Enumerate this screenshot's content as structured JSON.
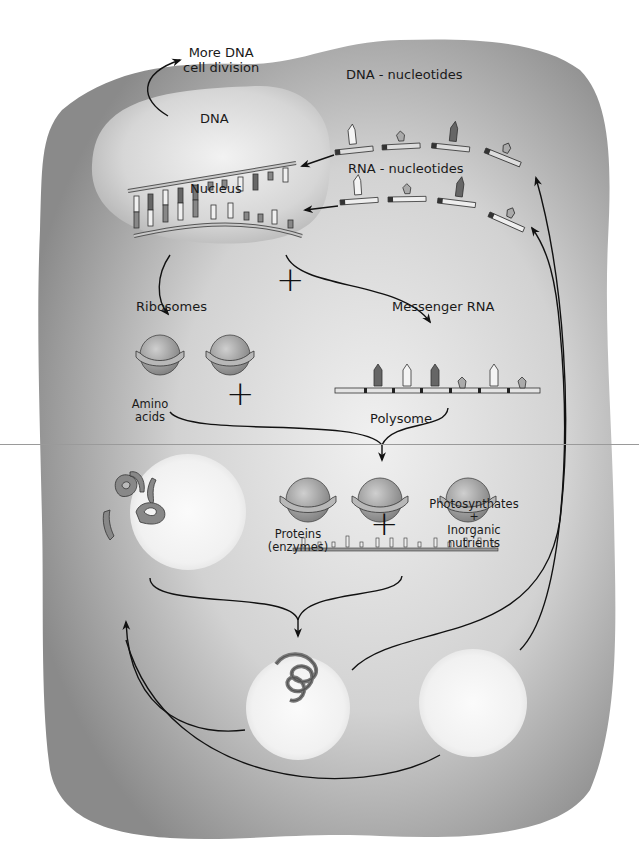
{
  "diagram": {
    "title": "",
    "colors": {
      "page_bg": "#ffffff",
      "cell_dark": "#8e8e8e",
      "cell_light": "#e8e8e8",
      "nucleus": "#d4d4d4",
      "circle_bg": "#f4f4f4",
      "ink": "#1a1a1a",
      "ribosome": "#a8a8a8",
      "base_dark": "#6a6a6a",
      "base_light": "#f2f2f2"
    },
    "labels": {
      "more_dna_line1": "More DNA",
      "more_dna_line2": "cell division",
      "dna": "DNA",
      "nucleus": "Nucleus",
      "dna_nucleotides": "DNA - nucleotides",
      "rna_nucleotides": "RNA - nucleotides",
      "ribosomes": "Ribosomes",
      "messenger_rna": "Messenger RNA",
      "amino_line1": "Amino",
      "amino_line2": "acids",
      "polysome": "Polysome",
      "proteins_line1": "Proteins",
      "proteins_line2": "(enzymes)",
      "photo_line1": "Photosynthates",
      "photo_plus": "+",
      "photo_line2": "Inorganic",
      "photo_line3": "nutrients"
    },
    "operators": {
      "plus_ribosomes_mrna": "+",
      "plus_amino_polysome": "+",
      "plus_proteins_photo": "+"
    },
    "nodes": [
      {
        "id": "nucleus",
        "label": "Nucleus"
      },
      {
        "id": "dna",
        "label": "DNA"
      },
      {
        "id": "dna_nucleotides",
        "label": "DNA - nucleotides"
      },
      {
        "id": "rna_nucleotides",
        "label": "RNA - nucleotides"
      },
      {
        "id": "more_dna",
        "label": "More DNA cell division"
      },
      {
        "id": "ribosomes",
        "label": "Ribosomes"
      },
      {
        "id": "mrna",
        "label": "Messenger RNA"
      },
      {
        "id": "amino_acids",
        "label": "Amino acids"
      },
      {
        "id": "polysome",
        "label": "Polysome"
      },
      {
        "id": "proteins",
        "label": "Proteins (enzymes)"
      },
      {
        "id": "photosynthates",
        "label": "Photosynthates + Inorganic nutrients"
      }
    ],
    "edges": [
      {
        "from": "dna",
        "to": "more_dna"
      },
      {
        "from": "dna_nucleotides",
        "to": "dna"
      },
      {
        "from": "rna_nucleotides",
        "to": "dna"
      },
      {
        "from": "nucleus",
        "to": "ribosomes"
      },
      {
        "from": "nucleus",
        "to": "mrna"
      },
      {
        "from": "ribosomes",
        "to": "polysome"
      },
      {
        "from": "mrna",
        "to": "polysome"
      },
      {
        "from": "amino_acids",
        "to": "proteins"
      },
      {
        "from": "polysome",
        "to": "proteins"
      },
      {
        "from": "proteins",
        "to": "amino_acids"
      },
      {
        "from": "photosynthates",
        "to": "amino_acids"
      },
      {
        "from": "proteins",
        "to": "dna_nucleotides"
      },
      {
        "from": "photosynthates",
        "to": "rna_nucleotides"
      }
    ]
  }
}
